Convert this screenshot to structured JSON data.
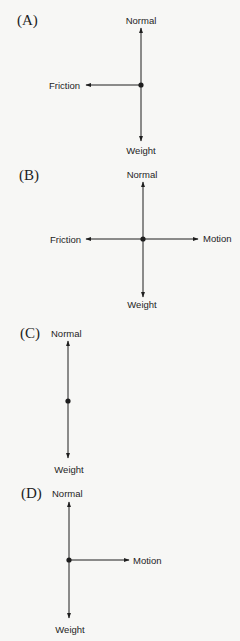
{
  "diagrams": [
    {
      "id": "A",
      "label": "(A)",
      "forces": {
        "normal": "Normal",
        "weight": "Weight",
        "friction": "Friction"
      }
    },
    {
      "id": "B",
      "label": "(B)",
      "forces": {
        "normal": "Normal",
        "weight": "Weight",
        "friction": "Friction",
        "motion": "Motion"
      }
    },
    {
      "id": "C",
      "label": "(C)",
      "forces": {
        "normal": "Normal",
        "weight": "Weight"
      }
    },
    {
      "id": "D",
      "label": "(D)",
      "forces": {
        "normal": "Normal",
        "weight": "Weight",
        "motion": "Motion"
      }
    }
  ],
  "colors": {
    "background": "#f7f7f5",
    "ink": "#1e1e1e"
  }
}
